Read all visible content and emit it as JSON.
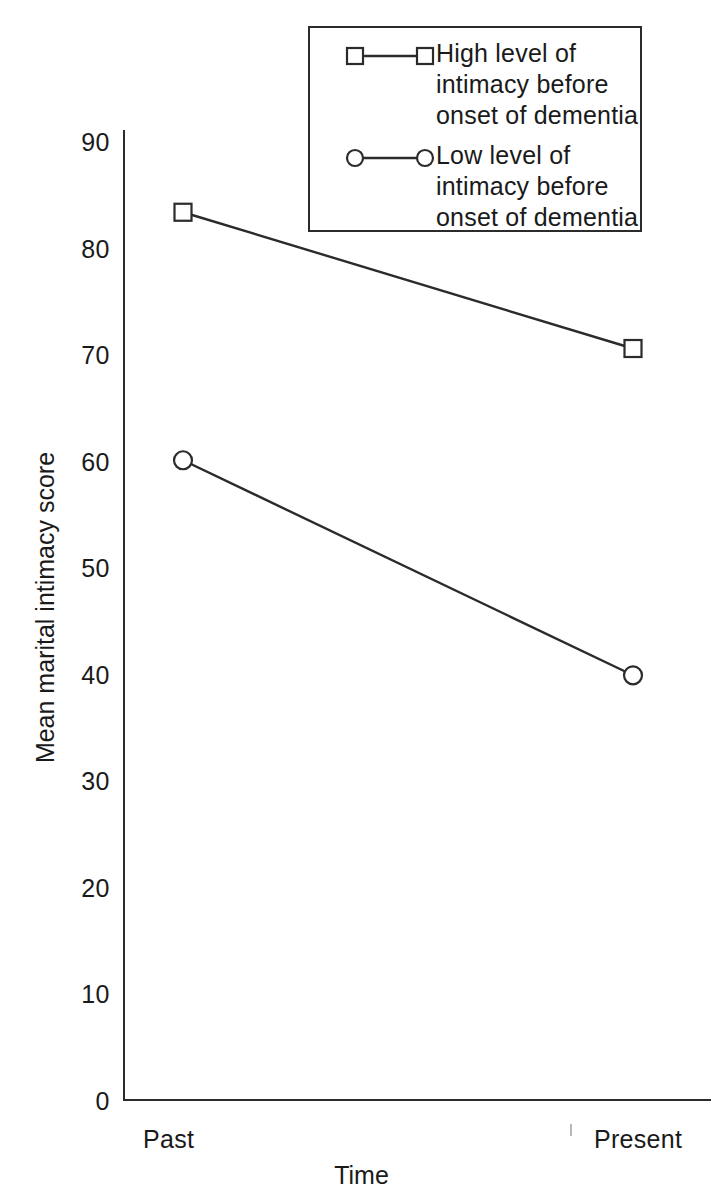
{
  "chart_data": {
    "type": "line",
    "title": "",
    "subtitle": "",
    "xlabel": "Time",
    "ylabel": "Mean marital intimacy score",
    "categories": [
      "Past",
      "Present"
    ],
    "series": [
      {
        "name": "High level of intimacy before onset of dementia",
        "marker": "square",
        "values": [
          83.4,
          70.6
        ]
      },
      {
        "name": "Low level of intimacy before onset of dementia",
        "marker": "circle",
        "values": [
          60.1,
          39.9
        ]
      }
    ],
    "ylim": [
      0,
      90
    ],
    "yticks": [
      0,
      10,
      20,
      30,
      40,
      50,
      60,
      70,
      80,
      90
    ],
    "ytick_labels": [
      "0",
      "10",
      "20",
      "30",
      "40",
      "50",
      "60",
      "70",
      "80",
      "90"
    ],
    "xtick_labels": [
      "Past",
      "Present"
    ],
    "grid": false,
    "legend_position": "top-right",
    "line_color": "#2b2b2b",
    "marker_fill": "#ffffff",
    "background": "#ffffff"
  },
  "axes": {
    "y_title": "Mean marital intimacy score",
    "x_title": "Time",
    "y_tick_labels": [
      "90",
      "80",
      "70",
      "60",
      "50",
      "40",
      "30",
      "20",
      "10",
      "0"
    ],
    "x_tick_labels": [
      "Past",
      "Present"
    ]
  },
  "legend": {
    "entries": [
      {
        "label": "High level of\nintimacy before\nonset of dementia",
        "marker": "square-marker"
      },
      {
        "label": "Low level of\nintimacy before\nonset of dementia",
        "marker": "circle-marker"
      }
    ]
  }
}
